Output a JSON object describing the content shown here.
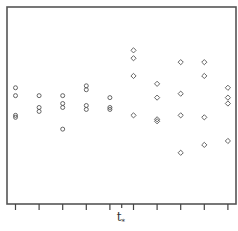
{
  "chart_data": {
    "type": "scatter",
    "title": "",
    "xlabel": "t*",
    "ylabel": "",
    "grid": false,
    "legend": null,
    "annotations": [
      "t*"
    ],
    "x_ticks_count": 10,
    "x_tick_labels": [],
    "y_tick_labels": [],
    "t_star_position": 5.5,
    "ylim": [
      0,
      100
    ],
    "xlim": [
      0.6,
      10.4
    ],
    "series": [
      {
        "name": "before t*",
        "marker": "circle",
        "points": [
          {
            "x": 1,
            "y": 59
          },
          {
            "x": 1,
            "y": 55
          },
          {
            "x": 1,
            "y": 45
          },
          {
            "x": 1,
            "y": 44
          },
          {
            "x": 2,
            "y": 55
          },
          {
            "x": 2,
            "y": 49
          },
          {
            "x": 2,
            "y": 47
          },
          {
            "x": 3,
            "y": 55
          },
          {
            "x": 3,
            "y": 51
          },
          {
            "x": 3,
            "y": 49
          },
          {
            "x": 3,
            "y": 38
          },
          {
            "x": 4,
            "y": 60
          },
          {
            "x": 4,
            "y": 58
          },
          {
            "x": 4,
            "y": 50
          },
          {
            "x": 4,
            "y": 48
          },
          {
            "x": 5,
            "y": 54
          },
          {
            "x": 5,
            "y": 49
          },
          {
            "x": 5,
            "y": 48
          }
        ]
      },
      {
        "name": "after t*",
        "marker": "diamond",
        "points": [
          {
            "x": 6,
            "y": 78
          },
          {
            "x": 6,
            "y": 74
          },
          {
            "x": 6,
            "y": 65
          },
          {
            "x": 6,
            "y": 45
          },
          {
            "x": 7,
            "y": 61
          },
          {
            "x": 7,
            "y": 54
          },
          {
            "x": 7,
            "y": 43
          },
          {
            "x": 7,
            "y": 42
          },
          {
            "x": 8,
            "y": 72
          },
          {
            "x": 8,
            "y": 56
          },
          {
            "x": 8,
            "y": 45
          },
          {
            "x": 8,
            "y": 26
          },
          {
            "x": 9,
            "y": 72
          },
          {
            "x": 9,
            "y": 65
          },
          {
            "x": 9,
            "y": 44
          },
          {
            "x": 9,
            "y": 30
          },
          {
            "x": 10,
            "y": 59
          },
          {
            "x": 10,
            "y": 54
          },
          {
            "x": 10,
            "y": 51
          },
          {
            "x": 10,
            "y": 32
          }
        ]
      }
    ]
  },
  "axis": {
    "t_star_label": "t",
    "t_star_sub": "*"
  }
}
